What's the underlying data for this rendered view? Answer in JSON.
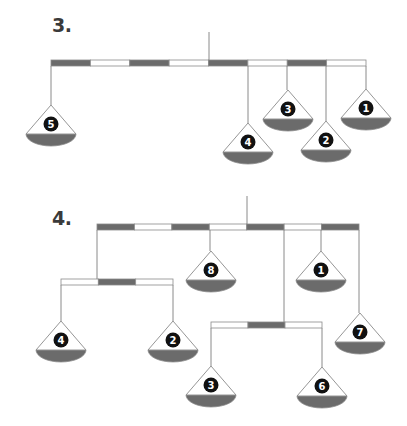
{
  "colors": {
    "beam_dark": "#6b6b6b",
    "beam_light": "#ffffff",
    "outline": "#8a8a8a",
    "pan_bowl": "#6b6b6b",
    "badge": "#111111",
    "label": "#3a3a3a"
  },
  "figures": [
    {
      "label": "3.",
      "label_pos": [
        52,
        21
      ],
      "pivot": {
        "x": 209,
        "y_top": 32,
        "y_bottom": 60
      },
      "beams": [
        {
          "x": 51,
          "y": 60,
          "w": 315,
          "h": 6,
          "segments": [
            "dark",
            "light",
            "dark",
            "light",
            "dark",
            "light",
            "dark",
            "light"
          ]
        }
      ],
      "strings": [
        {
          "x": 51,
          "y1": 66,
          "y2": 105
        },
        {
          "x": 248,
          "y1": 66,
          "y2": 123
        },
        {
          "x": 287,
          "y1": 66,
          "y2": 90
        },
        {
          "x": 326,
          "y1": 66,
          "y2": 121
        },
        {
          "x": 366,
          "y1": 66,
          "y2": 89
        }
      ],
      "pans": [
        {
          "number": "5",
          "x": 51,
          "apex_y": 105
        },
        {
          "number": "4",
          "x": 248,
          "apex_y": 123
        },
        {
          "number": "3",
          "x": 288,
          "apex_y": 90
        },
        {
          "number": "2",
          "x": 326,
          "apex_y": 121
        },
        {
          "number": "1",
          "x": 366,
          "apex_y": 89
        }
      ]
    },
    {
      "label": "4.",
      "label_pos": [
        52,
        214
      ],
      "pivot": {
        "x": 247,
        "y_top": 196,
        "y_bottom": 224
      },
      "beams": [
        {
          "x": 97,
          "y": 224,
          "w": 262,
          "h": 6,
          "segments": [
            "dark",
            "light",
            "dark",
            "light",
            "dark",
            "light",
            "dark"
          ]
        },
        {
          "x": 61,
          "y": 279,
          "w": 112,
          "h": 6,
          "segments": [
            "light",
            "dark",
            "light"
          ]
        },
        {
          "x": 211,
          "y": 322,
          "w": 111,
          "h": 6,
          "segments": [
            "light",
            "dark",
            "light"
          ]
        }
      ],
      "strings": [
        {
          "x": 97,
          "y1": 230,
          "y2": 279
        },
        {
          "x": 210,
          "y1": 230,
          "y2": 251
        },
        {
          "x": 284,
          "y1": 230,
          "y2": 322
        },
        {
          "x": 321,
          "y1": 230,
          "y2": 251
        },
        {
          "x": 359,
          "y1": 230,
          "y2": 313
        },
        {
          "x": 61,
          "y1": 285,
          "y2": 321
        },
        {
          "x": 173,
          "y1": 285,
          "y2": 321
        },
        {
          "x": 211,
          "y1": 328,
          "y2": 366
        },
        {
          "x": 322,
          "y1": 328,
          "y2": 367
        }
      ],
      "pans": [
        {
          "number": "8",
          "x": 211,
          "apex_y": 251
        },
        {
          "number": "1",
          "x": 321,
          "apex_y": 251
        },
        {
          "number": "4",
          "x": 61,
          "apex_y": 321
        },
        {
          "number": "2",
          "x": 173,
          "apex_y": 321
        },
        {
          "number": "7",
          "x": 360,
          "apex_y": 313
        },
        {
          "number": "3",
          "x": 211,
          "apex_y": 366
        },
        {
          "number": "6",
          "x": 322,
          "apex_y": 367
        }
      ]
    }
  ]
}
